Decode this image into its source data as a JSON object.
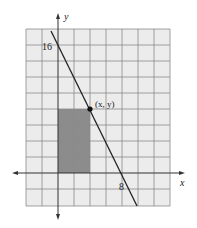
{
  "figure": {
    "axis_labels": {
      "x": "x",
      "y": "y"
    },
    "tick_labels": {
      "y_intercept": "16",
      "x_intercept": "8"
    },
    "point_label": "(x, y)",
    "colors": {
      "grid_fill": "#ececec",
      "grid_line": "#8a8a8a",
      "shaded_rect": "#8c8c8c",
      "axis": "#333333",
      "line": "#222222"
    },
    "units_per_cell": 2,
    "line": {
      "from": [
        0,
        16
      ],
      "to": [
        8,
        0
      ]
    },
    "point": [
      4,
      8
    ],
    "shaded_rectangle": {
      "x0": 0,
      "y0": 0,
      "x1": 4,
      "y1": 8
    }
  }
}
